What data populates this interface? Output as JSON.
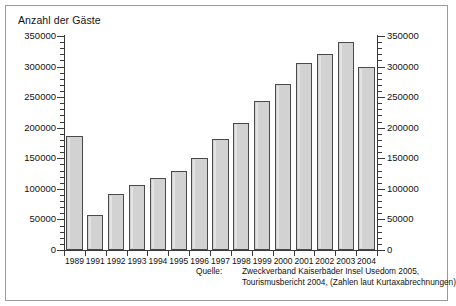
{
  "chart_data": {
    "type": "bar",
    "title": "Anzahl der Gäste",
    "xlabel": "",
    "ylabel": "",
    "ylim": [
      0,
      350000
    ],
    "grid": false,
    "legend": null,
    "categories": [
      "1989",
      "1991",
      "1992",
      "1993",
      "1994",
      "1995",
      "1996",
      "1997",
      "1998",
      "1999",
      "2000",
      "2001",
      "2002",
      "2003",
      "2004"
    ],
    "values": [
      187000,
      57000,
      92000,
      107000,
      117000,
      129000,
      151000,
      182000,
      208000,
      244000,
      272000,
      306000,
      321000,
      340000,
      300000
    ],
    "y_ticks": [
      0,
      50000,
      100000,
      150000,
      200000,
      250000,
      300000,
      350000
    ],
    "y_tick_labels": [
      "0",
      "50000",
      "100000",
      "150000",
      "200000",
      "250000",
      "300000",
      "350000"
    ],
    "y_minor_tick_step": 10000,
    "axis_right_mirrored": true,
    "bar_color": "#d2d2d2",
    "bar_edge_color": "#4a4a4a",
    "axis_color": "#3a3a3a",
    "annotations": []
  },
  "source": {
    "label": "Quelle:",
    "lines": [
      "Zweckverband Kaiserbäder Insel Usedom 2005,",
      "Tourismusbericht 2004, (Zahlen laut Kurtaxabrechnungen)"
    ]
  },
  "frame": {
    "border_color": "#9a9a9a",
    "background": "#ffffff"
  }
}
